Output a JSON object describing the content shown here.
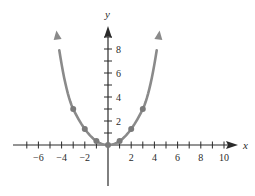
{
  "chart_data": {
    "type": "line",
    "title": "",
    "xlabel": "x",
    "ylabel": "y",
    "xlim": [
      -8,
      11
    ],
    "ylim": [
      -3.5,
      9.5
    ],
    "grid": false,
    "legend": null,
    "x_ticks": [
      -7,
      -6,
      -5,
      -4,
      -3,
      -2,
      -1,
      1,
      2,
      3,
      4,
      5,
      6,
      7,
      8,
      9,
      10
    ],
    "x_tick_labels": [
      "-6",
      "-4",
      "-2",
      "2",
      "4",
      "6",
      "8",
      "10"
    ],
    "x_tick_label_values": [
      -6,
      -4,
      -2,
      2,
      4,
      6,
      8,
      10
    ],
    "y_ticks": [
      1,
      2,
      3,
      4,
      5,
      6,
      7,
      8,
      9
    ],
    "y_tick_labels": [
      "2",
      "4",
      "6",
      "8"
    ],
    "y_tick_label_values": [
      2,
      4,
      6,
      8
    ],
    "series": [
      {
        "name": "y = x^2/3",
        "function": "x^2/3",
        "curve_x_range": [
          -4.2,
          4.2
        ],
        "arrows_at_ends": true,
        "color": "#8a8a8a",
        "points": [
          {
            "x": -3,
            "y": 3
          },
          {
            "x": -2,
            "y": 1.33
          },
          {
            "x": -1,
            "y": 0.33
          },
          {
            "x": 0,
            "y": 0
          },
          {
            "x": 1,
            "y": 0.33
          },
          {
            "x": 2,
            "y": 1.33
          },
          {
            "x": 3,
            "y": 3
          }
        ]
      }
    ],
    "colors": {
      "axis": "#2a2a2a",
      "curve": "#8a8a8a",
      "point": "#7a7a7a"
    }
  },
  "labels": {
    "x_axis": "x",
    "y_axis": "y"
  }
}
